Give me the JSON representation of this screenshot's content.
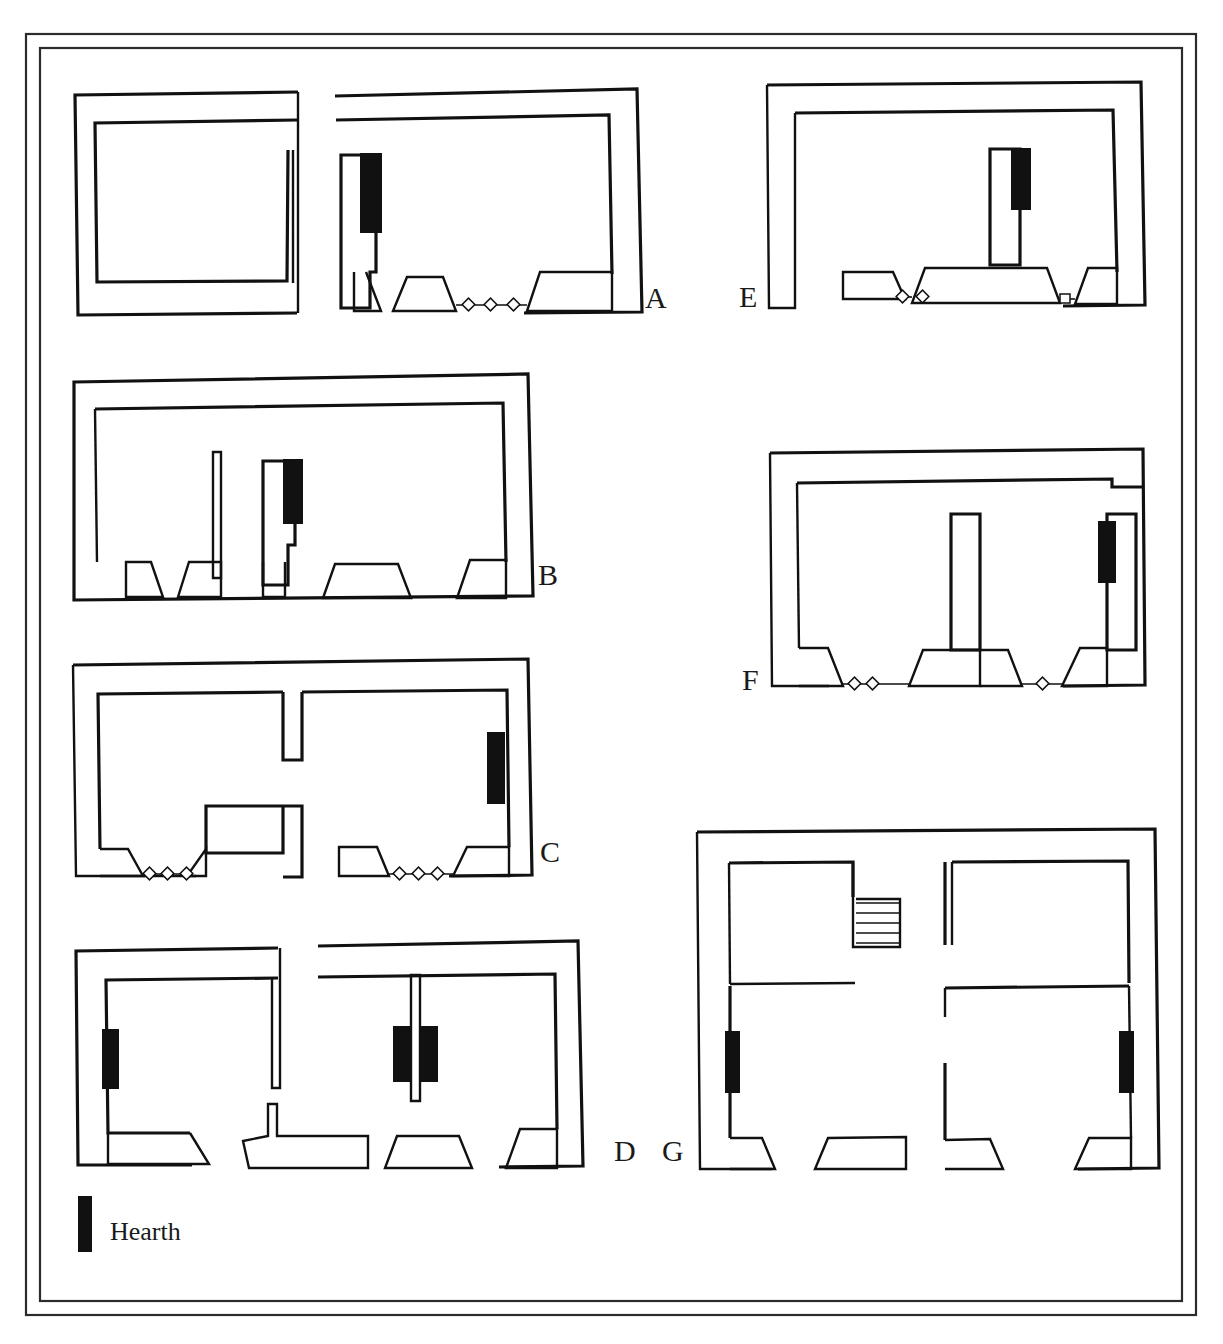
{
  "figure": {
    "type": "architectural-floor-plan-plate",
    "background_color": "#ffffff",
    "line_color": "#111111",
    "hearth_color": "#111111",
    "frame_color": "#2b2b2b"
  },
  "frame": {
    "outer": {
      "x": 26,
      "y": 34,
      "width": 1170,
      "height": 1281
    },
    "inner": {
      "x": 40,
      "y": 48,
      "width": 1142,
      "height": 1253
    }
  },
  "legend": {
    "swatch_name": "hearth-swatch",
    "label": "Hearth",
    "swatch": {
      "x": 78,
      "y": 1196,
      "width": 14,
      "height": 56
    },
    "text_position": {
      "x": 110,
      "y": 1240
    }
  },
  "plans": [
    {
      "id": "A",
      "label": "A",
      "label_position": {
        "x": 645,
        "y": 308
      },
      "structures": 2,
      "hearth_count": 1,
      "threshold_markers": 3,
      "buttresses": 3,
      "has_staircase": false,
      "notes": "Two separate rectangular enclosures; right structure has hearth on interior partition and a threshold with three diamond markers"
    },
    {
      "id": "B",
      "label": "B",
      "label_position": {
        "x": 538,
        "y": 585
      },
      "structures": 1,
      "hearth_count": 1,
      "threshold_markers": 0,
      "buttresses": 5,
      "has_staircase": false,
      "notes": "Single wide enclosure with two internal partition stubs, hearth against right-hand stub, five trapezoidal buttresses along the south wall"
    },
    {
      "id": "C",
      "label": "C",
      "label_position": {
        "x": 540,
        "y": 862
      },
      "structures": 1,
      "hearth_count": 1,
      "threshold_markers": 6,
      "buttresses": 4,
      "has_staircase": false,
      "notes": "Single enclosure split by an interrupted north-south spine wall; hearth on the east interior face; two threshold runs of three diamonds each"
    },
    {
      "id": "D",
      "label": "D",
      "label_position": {
        "x": 620,
        "y": 1161
      },
      "structures": 2,
      "hearth_count": 3,
      "threshold_markers": 0,
      "buttresses": 4,
      "has_staircase": false,
      "notes": "Two structures; left has a single hearth on the west wall, right has a pair of hearths flanking a central pier wall"
    },
    {
      "id": "E",
      "label": "E",
      "label_position": {
        "x": 745,
        "y": 307
      },
      "structures": 1,
      "hearth_count": 1,
      "threshold_markers": 3,
      "buttresses": 3,
      "has_staircase": false,
      "notes": "Single enclosure with a tall central pier carrying the hearth; wide trapezoidal buttress at the pier base"
    },
    {
      "id": "F",
      "label": "F",
      "label_position": {
        "x": 748,
        "y": 690
      },
      "structures": 1,
      "hearth_count": 1,
      "threshold_markers": 3,
      "buttresses": 4,
      "has_staircase": false,
      "notes": "Single enclosure with a long central pier wall; hearth set against the east interior return; notch in north-east outer wall"
    },
    {
      "id": "G",
      "label": "G",
      "label_position": {
        "x": 668,
        "y": 1161
      },
      "structures": 1,
      "hearth_count": 2,
      "threshold_markers": 0,
      "buttresses": 4,
      "has_staircase": true,
      "staircase_treads": 5,
      "notes": "Largest plan: four-room house with a staircase in the north-central area and hearths on the west and east interior walls"
    }
  ]
}
